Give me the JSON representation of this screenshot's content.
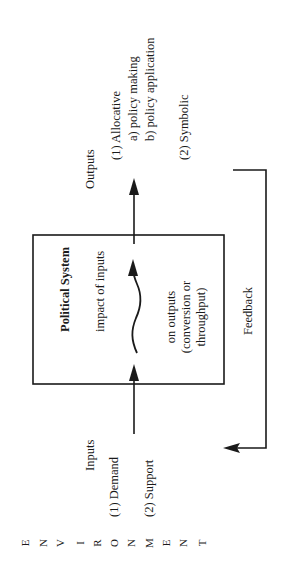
{
  "diagram": {
    "type": "systems-model",
    "orientation": "rotated-90-ccw",
    "environment_label": [
      "E",
      "N",
      "V",
      "I",
      "R",
      "O",
      "N",
      "M",
      "E",
      "N",
      "T"
    ],
    "system_box": {
      "title": "Political System",
      "line1": "impact of inputs",
      "line2": "on outputs",
      "line3": "(conversion or",
      "line4": "throughput)"
    },
    "inputs": {
      "title": "Inputs",
      "items": [
        "(1) Demand",
        "(2) Support"
      ]
    },
    "outputs": {
      "title": "Outputs",
      "item1": "(1) Allocative",
      "item1a": "a) policy making",
      "item1b": "b) policy application",
      "item2": "(2) Symbolic"
    },
    "feedback": {
      "label": "Feedback"
    },
    "colors": {
      "ink": "#1a1a1a",
      "background": "#ffffff"
    }
  }
}
